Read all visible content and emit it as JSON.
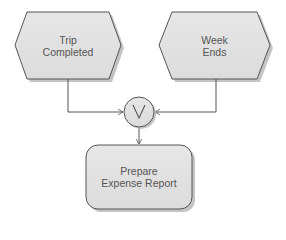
{
  "diagram": {
    "type": "event-driven process chain",
    "nodes": [
      {
        "id": "trip_completed",
        "shape": "hexagon",
        "kind": "event",
        "line1": "Trip",
        "line2": "Completed"
      },
      {
        "id": "week_ends",
        "shape": "hexagon",
        "kind": "event",
        "line1": "Week",
        "line2": "Ends"
      },
      {
        "id": "or_connector",
        "shape": "circle",
        "kind": "connector",
        "symbol": "V"
      },
      {
        "id": "prepare_expense_report",
        "shape": "rounded-rectangle",
        "kind": "function",
        "line1": "Prepare",
        "line2": "Expense Report"
      }
    ],
    "edges": [
      {
        "from": "trip_completed",
        "to": "or_connector"
      },
      {
        "from": "week_ends",
        "to": "or_connector"
      },
      {
        "from": "or_connector",
        "to": "prepare_expense_report"
      }
    ],
    "colors": {
      "shape_fill": "#e2e2e2",
      "shape_stroke": "#555555",
      "shadow": "#bdbdbd",
      "text": "#555555",
      "line": "#555555"
    }
  }
}
